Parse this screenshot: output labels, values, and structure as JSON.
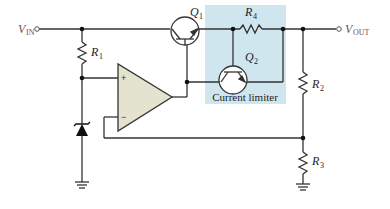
{
  "diagram": {
    "type": "series voltage regulator with current limiting",
    "labels": {
      "vin": {
        "main": "V",
        "sub": "IN"
      },
      "vout": {
        "main": "V",
        "sub": "OUT"
      },
      "r1": {
        "main": "R",
        "sub": "1"
      },
      "r2": {
        "main": "R",
        "sub": "2"
      },
      "r3": {
        "main": "R",
        "sub": "3"
      },
      "r4": {
        "main": "R",
        "sub": "4"
      },
      "q1": {
        "main": "Q",
        "sub": "1"
      },
      "q2": {
        "main": "Q",
        "sub": "2"
      },
      "current_limiter": "Current limiter",
      "opamp_plus": "+",
      "opamp_minus": "−"
    },
    "colors": {
      "wire": "#333333",
      "opamp_fill": "#e3e3cf",
      "limiter_box": "#cfe6ef",
      "io_label": "#7a4b55"
    },
    "components": [
      "R1",
      "R2",
      "R3",
      "R4",
      "Q1",
      "Q2",
      "Zener diode",
      "Op-amp",
      "Ground x2"
    ]
  }
}
